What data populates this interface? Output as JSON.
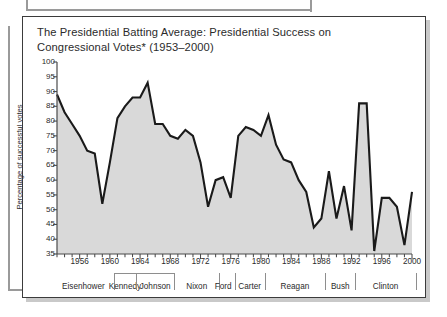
{
  "figure": {
    "title": "The Presidential Batting Average: Presidential Success on Congressional Votes* (1953–2000)"
  },
  "chart_data": {
    "type": "area",
    "title": "The Presidential Batting Average: Presidential Success on Congressional Votes* (1953–2000)",
    "xlabel": "",
    "ylabel": "Percentage of successful votes",
    "xlim": [
      1953,
      2000
    ],
    "ylim": [
      35,
      100
    ],
    "ytick_labels": [
      "100",
      "95",
      "90",
      "85",
      "80",
      "75",
      "70",
      "65",
      "60",
      "55",
      "50",
      "45",
      "40",
      "35"
    ],
    "yticks": [
      100,
      95,
      90,
      85,
      80,
      75,
      70,
      65,
      60,
      55,
      50,
      45,
      40,
      35
    ],
    "xtick_labels": [
      "1956",
      "1960",
      "1964",
      "1968",
      "1972",
      "1976",
      "1980",
      "1984",
      "1988",
      "1992",
      "1996",
      "2000"
    ],
    "xticks": [
      1956,
      1960,
      1964,
      1968,
      1972,
      1976,
      1980,
      1984,
      1988,
      1992,
      1996,
      2000
    ],
    "grid": false,
    "legend": "none",
    "fill_color": "#d9d9d9",
    "line_color": "#1a1a1a",
    "x": [
      1953,
      1954,
      1955,
      1956,
      1957,
      1958,
      1959,
      1960,
      1961,
      1962,
      1963,
      1964,
      1965,
      1966,
      1967,
      1968,
      1969,
      1970,
      1971,
      1972,
      1973,
      1974,
      1975,
      1976,
      1977,
      1978,
      1979,
      1980,
      1981,
      1982,
      1983,
      1984,
      1985,
      1986,
      1987,
      1988,
      1989,
      1990,
      1991,
      1992,
      1993,
      1994,
      1995,
      1996,
      1997,
      1998,
      1999,
      2000
    ],
    "values": [
      89,
      83,
      79,
      75,
      70,
      69,
      52,
      66,
      81,
      85,
      88,
      88,
      93,
      79,
      79,
      75,
      74,
      77,
      75,
      66,
      51,
      60,
      61,
      54,
      75,
      78,
      77,
      75,
      82,
      72,
      67,
      66,
      60,
      56,
      44,
      47,
      63,
      47,
      58,
      43,
      86,
      86,
      36,
      54,
      54,
      51,
      38,
      56
    ],
    "annotations": [
      {
        "label": "Eisenhower",
        "start": 1953,
        "end": 1960
      },
      {
        "label": "Kennedy",
        "start": 1961,
        "end": 1963
      },
      {
        "label": "Johnson",
        "start": 1964,
        "end": 1968
      },
      {
        "label": "Nixon",
        "start": 1969,
        "end": 1974
      },
      {
        "label": "Ford",
        "start": 1974,
        "end": 1976
      },
      {
        "label": "Carter",
        "start": 1977,
        "end": 1980
      },
      {
        "label": "Reagan",
        "start": 1981,
        "end": 1988
      },
      {
        "label": "Bush",
        "start": 1989,
        "end": 1992
      },
      {
        "label": "Clinton",
        "start": 1993,
        "end": 2000
      }
    ]
  }
}
